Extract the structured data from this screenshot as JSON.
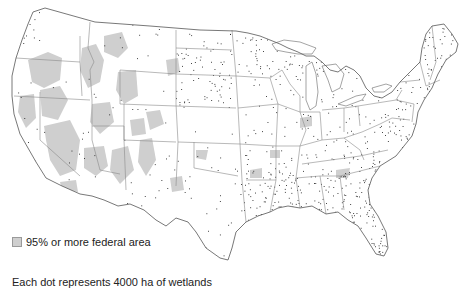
{
  "map": {
    "subject": "Wetlands of the conterminous United States",
    "region": "Conterminous United States",
    "colors": {
      "background": "#ffffff",
      "land": "#ffffff",
      "federal_area": "#cfcfcf",
      "state_border": "#8a8a8a",
      "outline": "#555555",
      "dot": "#1a1a1a",
      "water": "#ffffff"
    }
  },
  "legend": {
    "federal_area_label": "95% or more federal area",
    "dot_label": "Each dot represents 4000 ha of wetlands"
  }
}
